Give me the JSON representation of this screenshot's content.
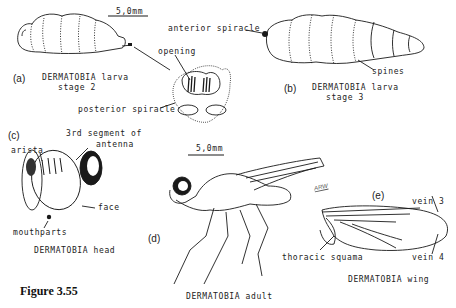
{
  "figure": {
    "caption": "Figure 3.55"
  },
  "panels": {
    "a": {
      "tag": "(a)",
      "title_line1": "DERMATOBIA larva",
      "title_line2": "stage 2",
      "scale": "5,0mm",
      "labels": {
        "opening": "opening",
        "posterior_spiracle": "posterior spiracle"
      }
    },
    "b": {
      "tag": "(b)",
      "title_line1": "DERMATOBIA larva",
      "title_line2": "stage 3",
      "labels": {
        "anterior_spiracle": "anterior spiracle",
        "spines": "spines"
      }
    },
    "c": {
      "tag": "(c)",
      "title": "DERMATOBIA head",
      "labels": {
        "arista": "arista",
        "antenna_line1": "3rd segment of",
        "antenna_line2": "antenna",
        "face": "face",
        "mouthparts": "mouthparts"
      }
    },
    "d": {
      "tag": "(d)",
      "title": "DERMATOBIA adult",
      "scale": "5,0mm",
      "signature": "ARW"
    },
    "e": {
      "tag": "(e)",
      "title": "DERMATOBIA wing",
      "labels": {
        "vein3": "vein 3",
        "vein4": "vein 4",
        "thoracic_squama": "thoracic squama"
      }
    }
  },
  "colors": {
    "ink": "#1a1a1a",
    "background": "#ffffff"
  }
}
